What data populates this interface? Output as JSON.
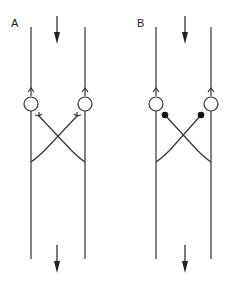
{
  "panels": [
    {
      "label": "A",
      "connection_type": "open-fork"
    },
    {
      "label": "B",
      "connection_type": "filled-dot"
    }
  ],
  "colors": {
    "stroke": "#333333",
    "background": "#ffffff"
  }
}
